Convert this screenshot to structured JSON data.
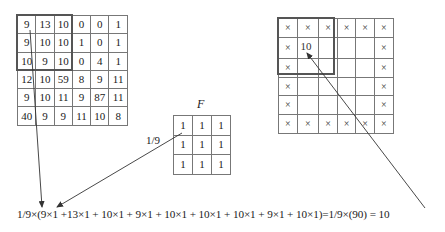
{
  "input_image": {
    "label": "",
    "rows": [
      [
        "9",
        "13",
        "10",
        "0",
        "0",
        "1"
      ],
      [
        "9",
        "10",
        "10",
        "1",
        "0",
        "1"
      ],
      [
        "10",
        "9",
        "10",
        "0",
        "4",
        "1"
      ],
      [
        "12",
        "10",
        "59",
        "8",
        "9",
        "11"
      ],
      [
        "9",
        "10",
        "11",
        "9",
        "87",
        "11"
      ],
      [
        "40",
        "9",
        "9",
        "11",
        "10",
        "8"
      ]
    ],
    "highlight": {
      "row_start": 0,
      "col_start": 0,
      "size": 3
    }
  },
  "filter": {
    "label": "F",
    "scale_label": "1/9",
    "rows": [
      [
        "1",
        "1",
        "1"
      ],
      [
        "1",
        "1",
        "1"
      ],
      [
        "1",
        "1",
        "1"
      ]
    ]
  },
  "output_image": {
    "rows": [
      [
        "×",
        "×",
        "×",
        "×",
        "×",
        "×"
      ],
      [
        "×",
        "10",
        "",
        "",
        "",
        "×"
      ],
      [
        "×",
        "",
        "",
        "",
        "",
        "×"
      ],
      [
        "×",
        "",
        "",
        "",
        "",
        "×"
      ],
      [
        "×",
        "",
        "",
        "",
        "",
        "×"
      ],
      [
        "×",
        "×",
        "×",
        "×",
        "×",
        "×"
      ]
    ],
    "highlight": {
      "row_start": 0,
      "col_start": 0,
      "size": 3
    },
    "result_cell": {
      "row": 1,
      "col": 1,
      "value": "10"
    }
  },
  "equation": {
    "text": "1/9×(9×1 +13×1 + 10×1 + 9×1 + 10×1 + 10×1 + 10×1 + 9×1 + 10×1)=1/9×(90) = 10"
  },
  "colors": {
    "grid_line": "#777777",
    "highlight_border": "#555555",
    "text": "#1a1a1a",
    "arrow": "#333333"
  }
}
